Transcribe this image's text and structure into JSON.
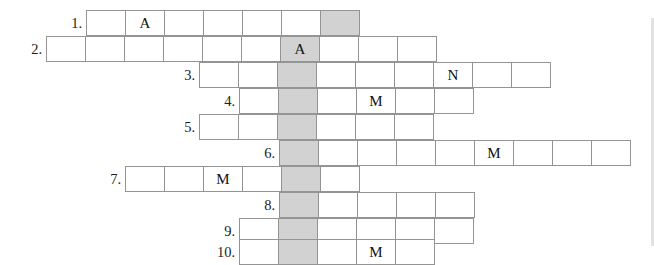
{
  "puzzle": {
    "title": "crossword-grid",
    "cell_width": 40,
    "cell_height": 26,
    "shaded_column_x": 280,
    "shaded_color": "#d2d2d2",
    "grid_line_color": "#949494",
    "rows": [
      {
        "number": "1.",
        "x": 87,
        "y": 10,
        "count": 7,
        "shaded_index": 6,
        "letters": [
          "",
          "A",
          "",
          "",
          "",
          "",
          ""
        ]
      },
      {
        "number": "2.",
        "x": 47,
        "y": 36,
        "count": 10,
        "shaded_index": 6,
        "letters": [
          "",
          "",
          "",
          "",
          "",
          "",
          "A",
          "",
          "",
          ""
        ]
      },
      {
        "number": "3.",
        "x": 200,
        "y": 62,
        "count": 9,
        "shaded_index": 2,
        "letters": [
          "",
          "",
          "",
          "",
          "",
          "",
          "N",
          "",
          ""
        ]
      },
      {
        "number": "4.",
        "x": 240,
        "y": 88,
        "count": 6,
        "shaded_index": 1,
        "letters": [
          "",
          "",
          "",
          "M",
          "",
          ""
        ]
      },
      {
        "number": "5.",
        "x": 200,
        "y": 114,
        "count": 6,
        "shaded_index": 2,
        "letters": [
          "",
          "",
          "",
          "",
          "",
          ""
        ]
      },
      {
        "number": "6.",
        "x": 280,
        "y": 140,
        "count": 9,
        "shaded_index": 0,
        "letters": [
          "",
          "",
          "",
          "",
          "",
          "M",
          "",
          "",
          ""
        ]
      },
      {
        "number": "7.",
        "x": 126,
        "y": 166,
        "count": 6,
        "shaded_index": 4,
        "letters": [
          "",
          "",
          "M",
          "",
          "",
          ""
        ]
      },
      {
        "number": "8.",
        "x": 280,
        "y": 192,
        "count": 5,
        "shaded_index": 0,
        "letters": [
          "",
          "",
          "",
          "",
          ""
        ]
      },
      {
        "number": "9.",
        "x": 240,
        "y": 218,
        "count": 6,
        "shaded_index": 1,
        "letters": [
          "",
          "",
          "",
          "",
          "",
          ""
        ]
      },
      {
        "number": "10.",
        "x": 240,
        "y": 239,
        "count": 5,
        "shaded_index": 1,
        "letters": [
          "",
          "",
          "",
          "M",
          ""
        ]
      }
    ]
  }
}
